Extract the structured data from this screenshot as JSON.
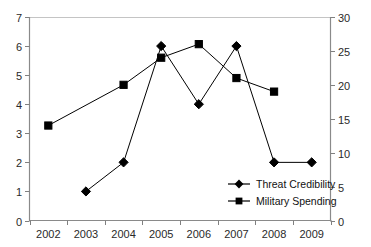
{
  "chart_data": {
    "type": "line",
    "title": "",
    "subtitle": "",
    "xlabel": "",
    "ylabel": "",
    "categories": [
      "2002",
      "2003",
      "2004",
      "2005",
      "2006",
      "2007",
      "2008",
      "2009"
    ],
    "grid": false,
    "legend_position": "inside-bottom-right",
    "axes": {
      "x": {
        "type": "category",
        "tick_labels": [
          "2002",
          "2003",
          "2004",
          "2005",
          "2006",
          "2007",
          "2008",
          "2009"
        ]
      },
      "y_left": {
        "label": "",
        "ylim": [
          0,
          7
        ],
        "step": 1,
        "tick_labels": [
          "0",
          "1",
          "2",
          "3",
          "4",
          "5",
          "6",
          "7"
        ]
      },
      "y_right": {
        "label": "",
        "ylim": [
          0,
          30
        ],
        "step": 5,
        "tick_labels": [
          "0",
          "5",
          "10",
          "15",
          "20",
          "25",
          "30"
        ]
      }
    },
    "series": [
      {
        "name": "Threat Credibility",
        "axis": "left",
        "marker": "diamond",
        "color": "#000000",
        "values": [
          null,
          1,
          2,
          6,
          4,
          6,
          2,
          2
        ]
      },
      {
        "name": "Military Spending",
        "axis": "right",
        "marker": "square",
        "color": "#000000",
        "values": [
          14,
          null,
          20,
          24,
          26,
          21,
          19,
          null
        ]
      }
    ]
  },
  "legend": {
    "entries": [
      {
        "label": "Threat Credibility",
        "marker": "diamond"
      },
      {
        "label": "Military Spending",
        "marker": "square"
      }
    ]
  },
  "colors": {
    "series": "#000000",
    "axis": "#808080",
    "plot_border": "#bdbdbd",
    "text": "#2a2a2a",
    "background": "#ffffff"
  }
}
